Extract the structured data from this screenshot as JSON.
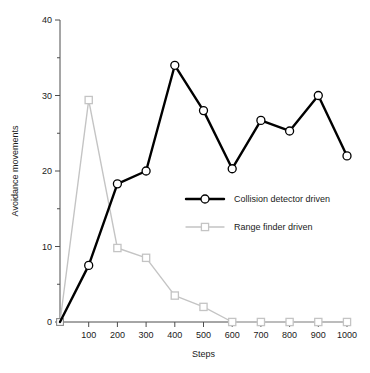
{
  "chart_data": {
    "type": "line",
    "title": "",
    "xlabel": "Steps",
    "ylabel": "Avoidance movements",
    "xlim": [
      0,
      1000
    ],
    "ylim": [
      0,
      40
    ],
    "grid": false,
    "legend_position": "center-right",
    "x": [
      0,
      100,
      200,
      300,
      400,
      500,
      600,
      700,
      800,
      900,
      1000
    ],
    "xticks": [
      "0",
      "100",
      "200",
      "300",
      "400",
      "500",
      "600",
      "700",
      "800",
      "900",
      "1000"
    ],
    "yticks": [
      "0",
      "10",
      "20",
      "30",
      "40"
    ],
    "yticks_minor": [
      5,
      15,
      25,
      35
    ],
    "series": [
      {
        "name": "Collision detector driven",
        "color": "#000000",
        "marker": "circle",
        "marker_fill": "#ffffff",
        "line_width": 2.4,
        "values": [
          0,
          7.5,
          18.3,
          20,
          34,
          28,
          20.3,
          26.7,
          25.3,
          30,
          22
        ]
      },
      {
        "name": "Range finder driven",
        "color": "#c4c4c4",
        "marker": "square",
        "marker_fill": "#ffffff",
        "line_width": 1.4,
        "values": [
          0,
          29.4,
          9.8,
          8.5,
          3.5,
          2,
          0,
          0,
          0,
          0,
          0
        ]
      }
    ]
  },
  "legend": {
    "entries": [
      {
        "label": "Collision detector driven"
      },
      {
        "label": "Range finder driven"
      }
    ]
  },
  "axes": {
    "x_title": "Steps",
    "y_title": "Avoidance movements"
  }
}
